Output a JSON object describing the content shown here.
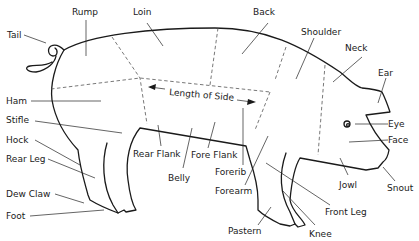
{
  "diagram": {
    "labels": {
      "tail": "Tail",
      "rump": "Rump",
      "loin": "Loin",
      "back": "Back",
      "shoulder": "Shoulder",
      "neck": "Neck",
      "ear": "Ear",
      "eye": "Eye",
      "face": "Face",
      "snout": "Snout",
      "jowl": "Jowl",
      "ham": "Ham",
      "stifle": "Stifle",
      "hock": "Hock",
      "rear_leg": "Rear Leg",
      "dew_claw": "Dew Claw",
      "foot": "Foot",
      "rear_flank": "Rear Flank",
      "fore_flank": "Fore Flank",
      "belly": "Belly",
      "forerib": "Forerib",
      "forearm": "Forearm",
      "pastern": "Pastern",
      "knee": "Knee",
      "front_leg": "Front Leg",
      "length_of_side": "Length of Side"
    }
  }
}
